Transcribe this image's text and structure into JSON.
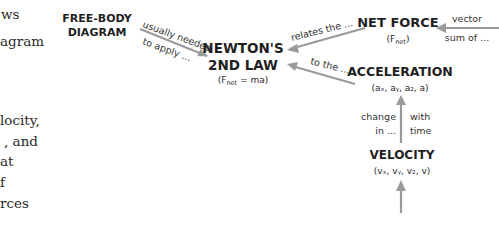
{
  "page_fragment": {
    "lines": [
      "ws",
      "agram",
      "locity,",
      ", and",
      "at",
      "f",
      "rces"
    ]
  },
  "diagram": {
    "colors": {
      "arrow": "#9a9a9a",
      "text": "#1f1f1f"
    },
    "nodes": {
      "free_body": {
        "line1": "FREE-BODY",
        "line2": "DIAGRAM"
      },
      "newton": {
        "line1": "NEWTON'S",
        "line2": "2ND LAW",
        "formula_pre": "(F",
        "formula_sub": "net",
        "formula_post": " = ma)"
      },
      "net_force": {
        "title": "NET FORCE",
        "sym_pre": "(F",
        "sym_sub": "net",
        "sym_post": ")"
      },
      "acceleration": {
        "title": "ACCELERATION",
        "components": "(aₓ, aᵧ, a₂, a)"
      },
      "velocity": {
        "title": "VELOCITY",
        "components": "(vₓ, vᵧ, v₂, v)"
      }
    },
    "edges": {
      "newton_to_fbd": {
        "label1": "usually needed",
        "label2": "to apply ..."
      },
      "netforce_to_newton": {
        "label": "relates the ..."
      },
      "accel_to_newton": {
        "label": "to the ..."
      },
      "incoming_netforce": {
        "label1": "vector",
        "label2": "sum of ..."
      },
      "velocity_to_accel": {
        "label_left1": "change",
        "label_left2": "in ...",
        "label_right1": "with",
        "label_right2": "time"
      }
    }
  }
}
